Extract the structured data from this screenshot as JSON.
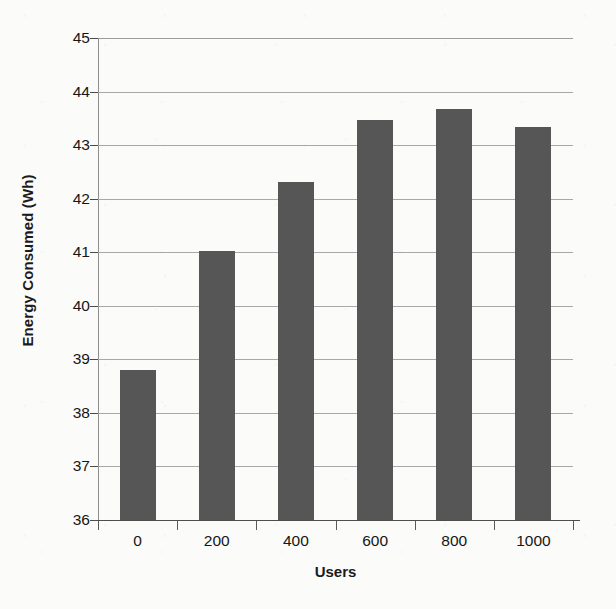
{
  "chart_data": {
    "type": "bar",
    "title": "",
    "xlabel": "Users",
    "ylabel": "Energy Consumed (Wh)",
    "categories": [
      "0",
      "200",
      "400",
      "600",
      "800",
      "1000"
    ],
    "values": [
      38.8,
      41.02,
      42.32,
      43.47,
      43.67,
      43.33
    ],
    "series": [
      {
        "name": "Energy Consumed",
        "values": [
          38.8,
          41.02,
          42.32,
          43.47,
          43.67,
          43.33
        ]
      }
    ],
    "ylim": [
      36,
      45
    ],
    "ytick_values": [
      45,
      44,
      43,
      42,
      41,
      40,
      39,
      38,
      37,
      36
    ],
    "ytick_labels": [
      "45",
      "44",
      "43",
      "42",
      "41",
      "40",
      "39",
      "38",
      "37",
      "36"
    ],
    "ytick_step": 1,
    "grid": true,
    "grid_axis": "y",
    "legend": false,
    "legend_position": "none",
    "bar_color": "#565656",
    "gridline_color": "#a8a8a8",
    "axis_color": "#4d4d4d",
    "background_color": "#fbfbf9",
    "text_color": "#161616"
  }
}
